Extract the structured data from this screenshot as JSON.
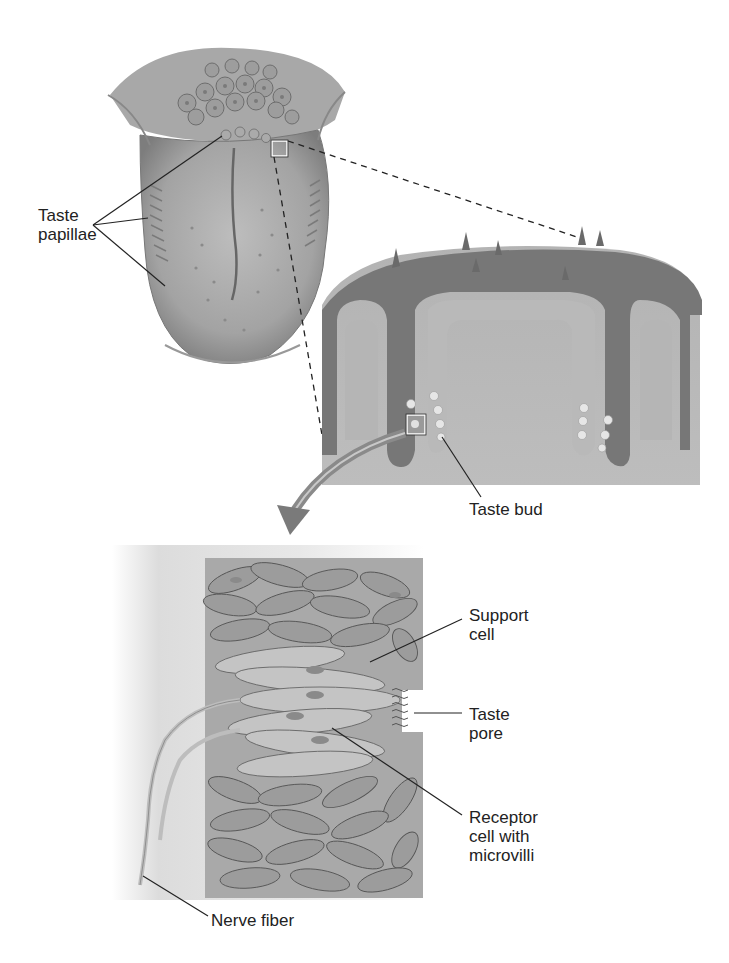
{
  "figure": {
    "colors": {
      "background": "#ffffff",
      "tissue_light": "#b8b8b8",
      "tissue_mid": "#9a9a9a",
      "tissue_dark": "#6e6e6e",
      "leader_line": "#222222",
      "label_text": "#222222"
    },
    "panels": [
      {
        "id": "tongue",
        "description": "Dorsal view of tongue with papillae"
      },
      {
        "id": "papilla-section",
        "description": "Cross-section of circumvallate papilla with taste buds"
      },
      {
        "id": "taste-bud-detail",
        "description": "Enlarged taste bud showing cells"
      }
    ],
    "labels": {
      "taste_papillae": [
        "Taste",
        "papillae"
      ],
      "taste_bud": [
        "Taste bud"
      ],
      "support_cell": [
        "Support",
        "cell"
      ],
      "taste_pore": [
        "Taste",
        "pore"
      ],
      "receptor_cell": [
        "Receptor",
        "cell with",
        "microvilli"
      ],
      "nerve_fiber": [
        "Nerve fiber"
      ]
    }
  }
}
